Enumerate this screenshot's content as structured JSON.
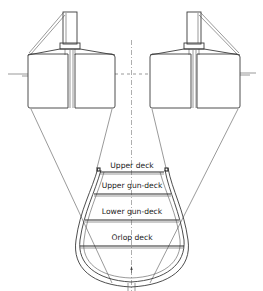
{
  "diagram": {
    "deck_labels": [
      {
        "label": "Upper deck"
      },
      {
        "label": "Upper gun-deck"
      },
      {
        "label": "Lower gun-deck"
      },
      {
        "label": "Orlop deck"
      }
    ],
    "parts": [
      "left-caisson",
      "right-caisson",
      "left-mast",
      "right-mast",
      "hull",
      "centerline",
      "waterline"
    ],
    "colors": {
      "line": "#3a3a3a",
      "background": "#ffffff"
    }
  }
}
